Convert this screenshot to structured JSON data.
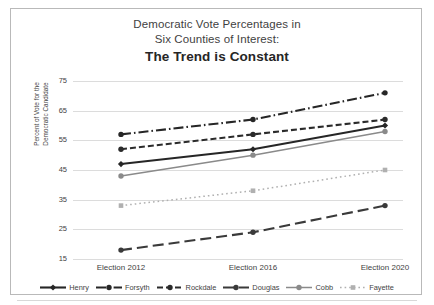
{
  "chart_data": {
    "type": "line",
    "title": "Democratic Vote Percentages in Six Counties of Interest: The Trend is Constant",
    "title_lines": [
      "Democratic Vote Percentages in",
      "Six Counties of Interest:",
      "The Trend is Constant"
    ],
    "xlabel": "",
    "ylabel": "Percent of Vote for the Democratic Candidate",
    "ylabel_lines": [
      "Percent of Vote for the",
      "Democratic Candidate"
    ],
    "categories": [
      "Election 2012",
      "Election 2016",
      "Election 2020"
    ],
    "yticks": [
      75,
      65,
      55,
      45,
      35,
      25,
      15
    ],
    "ylim": [
      15,
      75
    ],
    "grid": true,
    "legend_position": "bottom",
    "series": [
      {
        "name": "Henry",
        "values": [
          47,
          52,
          60
        ],
        "color": "#262626",
        "dash": "solid",
        "marker": "diamond"
      },
      {
        "name": "Forsyth",
        "values": [
          57,
          62,
          71
        ],
        "color": "#262626",
        "dash": "dash-dot",
        "marker": "circle"
      },
      {
        "name": "Rockdale",
        "values": [
          52,
          57,
          62
        ],
        "color": "#2b2b2b",
        "dash": "dash",
        "marker": "circle"
      },
      {
        "name": "Douglas",
        "values": [
          18,
          24,
          33
        ],
        "color": "#3a3a3a",
        "dash": "long-dash",
        "marker": "circle"
      },
      {
        "name": "Cobb",
        "values": [
          43,
          50,
          58
        ],
        "color": "#8a8a8a",
        "dash": "solid",
        "marker": "circle"
      },
      {
        "name": "Fayette",
        "values": [
          33,
          38,
          45
        ],
        "color": "#b0b0b0",
        "dash": "dot",
        "marker": "square"
      }
    ]
  }
}
